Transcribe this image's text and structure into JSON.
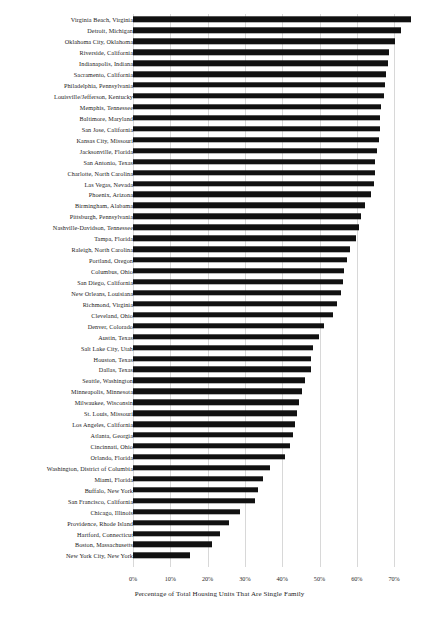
{
  "chart_data": {
    "type": "bar",
    "orientation": "horizontal",
    "title": "",
    "xlabel": "Percentage of Total Housing Units That Are Single Family",
    "ylabel": "",
    "xlim": [
      0,
      75
    ],
    "grid": true,
    "legend": "none",
    "xticks": [
      "0%",
      "10%",
      "20%",
      "30%",
      "40%",
      "50%",
      "60%",
      "70%"
    ],
    "xtick_values": [
      0,
      10,
      20,
      30,
      40,
      50,
      60,
      70
    ],
    "categories": [
      "Virginia Beach, Virginia",
      "Detroit, Michigan",
      "Oklahoma City, Oklahoma",
      "Riverside, California",
      "Indianapolis, Indiana",
      "Sacramento, California",
      "Philadelphia, Pennsylvania",
      "Louisville/Jefferson, Kentucky",
      "Memphis, Tennessee",
      "Baltimore, Maryland",
      "San Jose, California",
      "Kansas City, Missouri",
      "Jacksonville, Florida",
      "San Antonio, Texas",
      "Charlotte, North Carolina",
      "Las Vegas, Nevada",
      "Phoenix, Arizona",
      "Birmingham, Alabama",
      "Pittsburgh, Pennsylvania",
      "Nashville-Davidson, Tennessee",
      "Tampa, Florida",
      "Raleigh, North Carolina",
      "Portland, Oregon",
      "Columbus, Ohio",
      "San Diego, California",
      "New Orleans, Louisiana",
      "Richmond, Virginia",
      "Cleveland, Ohio",
      "Denver, Colorado",
      "Austin, Texas",
      "Salt Lake City, Utah",
      "Houston, Texas",
      "Dallas, Texas",
      "Seattle, Washington",
      "Minneapolis, Minnesota",
      "Milwaukee, Wisconsin",
      "St. Louis, Missouri",
      "Los Angeles, California",
      "Atlanta, Georgia",
      "Cincinnati, Ohio",
      "Orlando, Florida",
      "Washington, District of Columbia",
      "Miami, Florida",
      "Buffalo, New York",
      "San Francisco, California",
      "Chicago, Illinois",
      "Providence, Rhode Island",
      "Hartford, Connecticut",
      "Boston, Massachusetts",
      "New York City, New York"
    ],
    "values": [
      74.5,
      71.8,
      70.2,
      68.6,
      68.3,
      67.8,
      67.5,
      67.4,
      66.5,
      66.3,
      66.2,
      66.0,
      65.3,
      65.0,
      64.8,
      64.5,
      63.8,
      62.3,
      61.2,
      60.5,
      59.8,
      58.2,
      57.3,
      56.6,
      56.2,
      55.8,
      54.6,
      53.5,
      51.3,
      49.8,
      48.2,
      47.8,
      47.6,
      46.2,
      45.4,
      44.6,
      44.0,
      43.4,
      42.8,
      42.2,
      40.8,
      36.8,
      34.8,
      33.6,
      32.8,
      28.8,
      25.8,
      23.4,
      21.2,
      15.3
    ]
  },
  "axis": {
    "x_start_px": 133,
    "px_per_percent": 3.73
  }
}
